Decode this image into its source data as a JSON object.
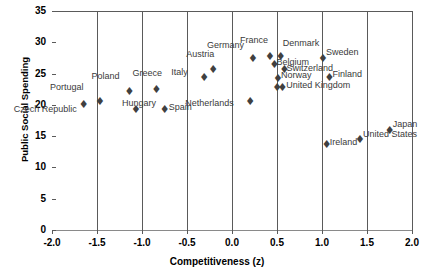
{
  "chart_data": {
    "type": "scatter",
    "title": "",
    "xlabel": "Competitiveness (z)",
    "ylabel": "Public Social Spending",
    "xlim": [
      -2.0,
      2.0
    ],
    "ylim": [
      0,
      35
    ],
    "xticks": [
      "-2.0",
      "-1.5",
      "-1.0",
      "-0.5",
      "0.0",
      "0.5",
      "1.0",
      "1.5",
      "2.0"
    ],
    "xtick_values": [
      -2.0,
      -1.5,
      -1.0,
      -0.5,
      0.0,
      0.5,
      1.0,
      1.5,
      2.0
    ],
    "yticks": [
      "0",
      "5",
      "10",
      "15",
      "20",
      "25",
      "30",
      "35"
    ],
    "ytick_values": [
      0,
      5,
      10,
      15,
      20,
      25,
      30,
      35
    ],
    "grid": "vertical",
    "legend": "none",
    "marker": "diamond",
    "points": [
      {
        "label": "Czech Republic",
        "x": -1.67,
        "y": 20.0,
        "lx": -68,
        "ly": 10
      },
      {
        "label": "Portugal",
        "x": -1.49,
        "y": 20.4,
        "lx": -48,
        "ly": -9
      },
      {
        "label": "Poland",
        "x": -1.16,
        "y": 22.0,
        "lx": -36,
        "ly": -10
      },
      {
        "label": "Hungary",
        "x": -1.09,
        "y": 19.2,
        "lx": -12,
        "ly": -1
      },
      {
        "label": "Greece",
        "x": -0.86,
        "y": 22.3,
        "lx": -22,
        "ly": -11
      },
      {
        "label": "Spain",
        "x": -0.77,
        "y": 19.2,
        "lx": 6,
        "ly": 3
      },
      {
        "label": "Italy",
        "x": -0.33,
        "y": 24.3,
        "lx": -31,
        "ly": 0
      },
      {
        "label": "Austria",
        "x": -0.23,
        "y": 25.6,
        "lx": -25,
        "ly": -10
      },
      {
        "label": "Netherlands",
        "x": 0.18,
        "y": 20.5,
        "lx": -63,
        "ly": 7
      },
      {
        "label": "Germany",
        "x": 0.21,
        "y": 27.3,
        "lx": -44,
        "ly": -8
      },
      {
        "label": "France",
        "x": 0.4,
        "y": 27.7,
        "lx": -28,
        "ly": -11
      },
      {
        "label": "Belgium",
        "x": 0.45,
        "y": 26.4,
        "lx": 4,
        "ly": 3
      },
      {
        "label": "Denmark",
        "x": 0.52,
        "y": 27.7,
        "lx": 4,
        "ly": -8
      },
      {
        "label": "Switzerland",
        "x": 0.56,
        "y": 25.6,
        "lx": 4,
        "ly": 4
      },
      {
        "label": "Norway",
        "x": 0.49,
        "y": 24.1,
        "lx": 5,
        "ly": 2
      },
      {
        "label": "United Kingdom",
        "x": 0.48,
        "y": 22.7,
        "lx": 11,
        "ly": 3
      },
      {
        "label": "",
        "x": 0.54,
        "y": 22.7,
        "lx": 0,
        "ly": 0
      },
      {
        "label": "Sweden",
        "x": 0.99,
        "y": 27.3,
        "lx": 5,
        "ly": -1
      },
      {
        "label": "Finland",
        "x": 1.06,
        "y": 24.3,
        "lx": 5,
        "ly": 2
      },
      {
        "label": "Ireland",
        "x": 1.03,
        "y": 13.6,
        "lx": 5,
        "ly": 3
      },
      {
        "label": "United States",
        "x": 1.4,
        "y": 14.4,
        "lx": 5,
        "ly": 0
      },
      {
        "label": "Japan",
        "x": 1.73,
        "y": 15.9,
        "lx": 5,
        "ly": -1
      }
    ]
  }
}
